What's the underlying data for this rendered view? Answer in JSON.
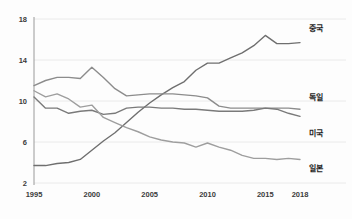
{
  "chart_data": {
    "type": "line",
    "title": "",
    "xlabel": "",
    "ylabel": "",
    "xlim": [
      1995,
      2018
    ],
    "ylim": [
      2,
      18
    ],
    "grid": true,
    "legend_position": "right-inline",
    "x": [
      1995,
      1996,
      1997,
      1998,
      1999,
      2000,
      2001,
      2002,
      2003,
      2004,
      2005,
      2006,
      2007,
      2008,
      2009,
      2010,
      2011,
      2012,
      2013,
      2014,
      2015,
      2016,
      2017,
      2018
    ],
    "xticks": [
      "1995",
      "2000",
      "2005",
      "2010",
      "2015",
      "2018"
    ],
    "yticks": [
      "2",
      "6",
      "10",
      "14",
      "18"
    ],
    "series": [
      {
        "name": "중국",
        "color": "#6f6f6f",
        "values": [
          3.7,
          3.7,
          3.9,
          4.0,
          4.3,
          5.2,
          6.1,
          6.9,
          7.9,
          8.9,
          9.8,
          10.6,
          11.3,
          11.9,
          13.0,
          13.7,
          13.7,
          14.2,
          14.7,
          15.4,
          16.4,
          15.6,
          15.6,
          15.7
        ]
      },
      {
        "name": "독일",
        "color": "#8c8c8c",
        "values": [
          11.5,
          12.0,
          12.3,
          12.3,
          12.2,
          13.3,
          12.3,
          11.2,
          10.5,
          10.6,
          10.7,
          10.7,
          10.7,
          10.6,
          10.5,
          10.3,
          9.5,
          9.3,
          9.3,
          9.3,
          9.3,
          9.3,
          9.3,
          9.2
        ]
      },
      {
        "name": "미국",
        "color": "#7a7a7a",
        "values": [
          10.4,
          9.3,
          9.3,
          8.8,
          9.0,
          9.1,
          8.7,
          8.8,
          9.3,
          9.4,
          9.4,
          9.3,
          9.3,
          9.2,
          9.2,
          9.1,
          9.0,
          9.0,
          9.0,
          9.1,
          9.3,
          9.2,
          8.8,
          8.5
        ]
      },
      {
        "name": "일본",
        "color": "#9e9e9e",
        "values": [
          11.0,
          10.4,
          10.7,
          10.2,
          9.4,
          9.6,
          8.4,
          7.9,
          7.4,
          7.0,
          6.5,
          6.2,
          6.0,
          5.9,
          5.5,
          5.9,
          5.5,
          5.2,
          4.7,
          4.4,
          4.4,
          4.3,
          4.4,
          4.3
        ]
      }
    ],
    "series_labels": [
      {
        "name": "중국"
      },
      {
        "name": "독일"
      },
      {
        "name": "미국"
      },
      {
        "name": "일본"
      }
    ]
  },
  "caption": {
    "text": ""
  }
}
